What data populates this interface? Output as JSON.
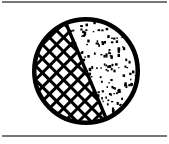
{
  "figure": {
    "title": "Hatched and stippled divided circle diagram",
    "canvas": {
      "width": 169,
      "height": 144,
      "background_color": "#ffffff"
    },
    "rules": {
      "color": "#4a4a4a",
      "top_y": 2,
      "bottom_y": 136,
      "thickness": 1.6,
      "left_x": 2,
      "right_x": 167
    },
    "circle": {
      "center_x": 86,
      "center_y": 71,
      "radius": 54,
      "outline_color": "#000000",
      "outline_width": 4.5,
      "fill_color": "#ffffff"
    },
    "divider": {
      "description": "straight chord splitting circle into two regions",
      "x1": 62,
      "y1": 14,
      "x2": 111,
      "y2": 130,
      "color": "#000000",
      "width": 3.4
    },
    "regions": [
      {
        "name": "stippled-region",
        "position": "left",
        "pattern": "stipple",
        "pattern_color": "#000000",
        "fill_color": "#ffffff",
        "dot_size_px": 1.8,
        "dot_count": 230,
        "share_label": "larger"
      },
      {
        "name": "crosshatch-region",
        "position": "right",
        "pattern": "diagonal-crosshatch",
        "pattern_color": "#000000",
        "fill_color": "#ffffff",
        "cell_size_px": 10,
        "stroke_width_px": 3,
        "angle_degrees": 45,
        "share_label": "smaller"
      }
    ]
  }
}
